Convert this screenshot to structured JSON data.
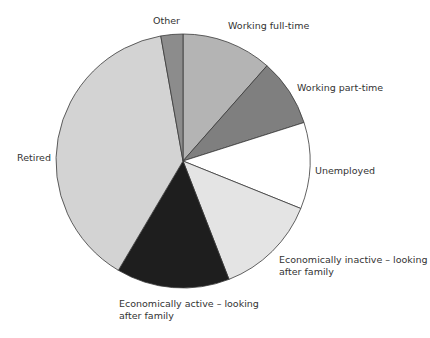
{
  "chart_data": {
    "type": "pie",
    "title": "",
    "start_angle_deg": 0,
    "direction": "clockwise",
    "slices": [
      {
        "label": "Working full-time",
        "value": 11.5,
        "color": "#b4b4b4"
      },
      {
        "label": "Working part-time",
        "value": 8.6,
        "color": "#7f7f7f"
      },
      {
        "label": "Unemployed",
        "value": 11.0,
        "color": "#ffffff"
      },
      {
        "label": "Economically inactive – looking after family",
        "value": 13.0,
        "color": "#e4e4e4"
      },
      {
        "label": "Economically active – looking after family",
        "value": 14.4,
        "color": "#1e1e1e"
      },
      {
        "label": "Retired",
        "value": 38.7,
        "color": "#d3d3d3"
      },
      {
        "label": "Other",
        "value": 2.8,
        "color": "#8c8c8c"
      }
    ]
  },
  "labels": {
    "other": "Other",
    "full_time": "Working full-time",
    "part_time": "Working part-time",
    "unemployed": "Unemployed",
    "inactive_line1": "Economically inactive – looking",
    "inactive_line2": "after family",
    "active_line1": "Economically active – looking",
    "active_line2": "after family",
    "retired": "Retired"
  }
}
